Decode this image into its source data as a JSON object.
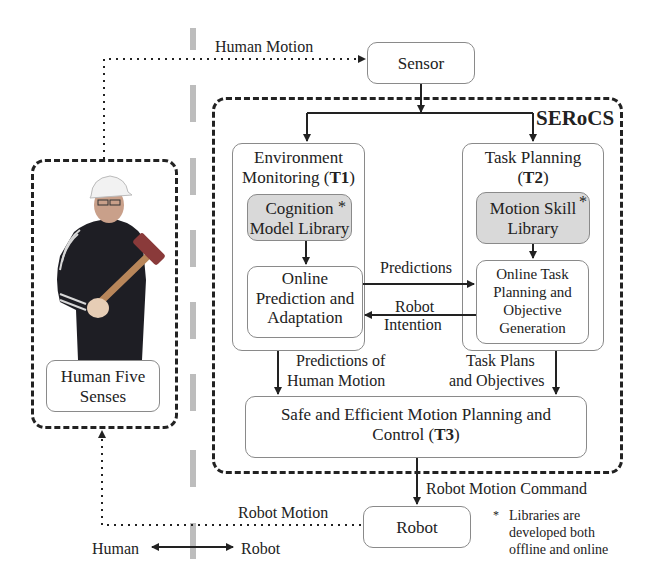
{
  "diagram": {
    "system_title": "SERoCS",
    "sides": {
      "left": "Human",
      "right": "Robot"
    },
    "nodes": {
      "sensor": "Sensor",
      "t1": {
        "title_line1": "Environment",
        "title_line2": "Monitoring (",
        "tag": "T1",
        "close": ")"
      },
      "cognition": {
        "line1": "Cognition",
        "line2": "Model Library",
        "star": "*"
      },
      "online_prediction": {
        "line1": "Online",
        "line2": "Prediction and",
        "line3": "Adaptation"
      },
      "t2": {
        "title_line1": "Task Planning",
        "open": "(",
        "tag": "T2",
        "close": ")"
      },
      "motion_skill": {
        "line1": "Motion Skill",
        "line2": "Library",
        "star": "*"
      },
      "online_task": {
        "line1": "Online Task",
        "line2": "Planning and",
        "line3": "Objective",
        "line4": "Generation"
      },
      "t3": {
        "line1": "Safe and Efficient Motion Planning and",
        "line2": "Control (",
        "tag": "T3",
        "close": ")"
      },
      "robot": "Robot",
      "human_senses": {
        "line1": "Human Five",
        "line2": "Senses"
      }
    },
    "edges": {
      "human_motion": "Human Motion",
      "predictions": "Predictions",
      "robot_intention_1": "Robot",
      "robot_intention_2": "Intention",
      "predictions_of_human_1": "Predictions of",
      "predictions_of_human_2": "Human Motion",
      "task_plans_1": "Task Plans",
      "task_plans_2": "and Objectives",
      "robot_motion_command": "Robot Motion Command",
      "robot_motion": "Robot Motion"
    },
    "footnote": {
      "star": "*",
      "line1": "Libraries are",
      "line2": "developed both",
      "line3": "offline and online"
    },
    "colors": {
      "line": "#222222",
      "box_border": "#8a8a8a",
      "library_fill": "#d9d9d9",
      "divider": "#bdbdbd"
    }
  }
}
